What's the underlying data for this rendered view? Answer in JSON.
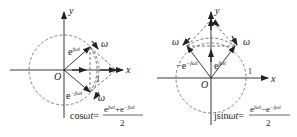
{
  "left": {
    "axis_x": "x",
    "axis_y": "y",
    "origin": "O",
    "unit": "1",
    "vec_pos": "e",
    "vec_pos_exp": "jωt",
    "vec_neg": "e",
    "vec_neg_exp": "−jωt",
    "omega_top": "ω",
    "omega_bottom": "ω",
    "formula_lhs": "cosωt=",
    "formula_num": "e",
    "formula_num_exp1": "jωt",
    "formula_num_plus": "+e",
    "formula_num_exp2": "−jωt",
    "formula_den": "2"
  },
  "right": {
    "axis_x": "x",
    "axis_y": "y",
    "origin": "O",
    "unit": "1",
    "vec_pos": "e",
    "vec_pos_exp": "jωt",
    "vec_neg": "−e",
    "vec_neg_exp": "−jωt",
    "omega_left": "ω",
    "omega_right": "ω",
    "formula_lhs": "jsinωt=",
    "formula_num": "e",
    "formula_num_exp1": "jωt",
    "formula_num_minus": "−e",
    "formula_num_exp2": "−jωt",
    "formula_den": "2"
  },
  "colors": {
    "line": "#222222",
    "dash": "#555555"
  }
}
